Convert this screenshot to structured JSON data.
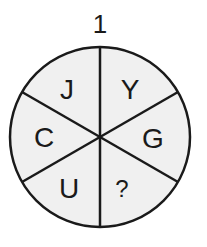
{
  "puzzle": {
    "number": "1",
    "shape": "circle divided into 6 sectors",
    "fill_color": "#f0f0f0",
    "stroke_color": "#1a1a1a",
    "sectors": [
      {
        "position": "top-left",
        "label": "J"
      },
      {
        "position": "top-right",
        "label": "Y"
      },
      {
        "position": "right",
        "label": "G"
      },
      {
        "position": "bottom-right",
        "label": "?"
      },
      {
        "position": "bottom-left",
        "label": "U"
      },
      {
        "position": "left",
        "label": "C"
      }
    ]
  }
}
